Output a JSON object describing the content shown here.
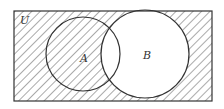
{
  "diagram": {
    "type": "venn",
    "universe_label": "U",
    "sets": [
      {
        "label": "A",
        "shaded": "only where outside B"
      },
      {
        "label": "B",
        "shaded": false
      }
    ],
    "shaded_region": "complement of B (U \\ B)",
    "colors": {
      "line": "#333333",
      "hatch": "#555555",
      "background": "#ffffff"
    }
  }
}
